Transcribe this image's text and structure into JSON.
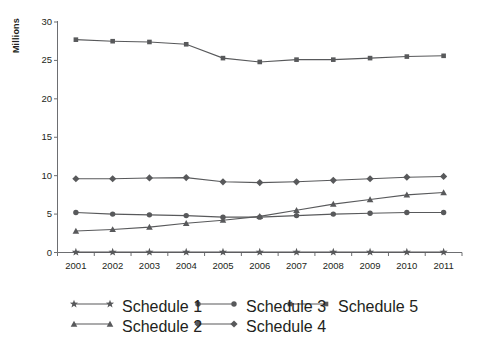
{
  "chart_data": {
    "type": "line",
    "title": "",
    "xlabel": "",
    "ylabel": "Millions",
    "categories": [
      "2001",
      "2002",
      "2003",
      "2004",
      "2005",
      "2006",
      "2007",
      "2008",
      "2009",
      "2010",
      "2011"
    ],
    "ylim": [
      0,
      30
    ],
    "yticks": [
      0,
      5,
      10,
      15,
      20,
      25,
      30
    ],
    "grid": false,
    "legend_position": "bottom",
    "series": [
      {
        "name": "Schedule 1",
        "marker": "star",
        "color": "#58595b",
        "values": [
          0.05,
          0.05,
          0.05,
          0.05,
          0.05,
          0.05,
          0.05,
          0.05,
          0.05,
          0.05,
          0.05
        ]
      },
      {
        "name": "Schedule 2",
        "marker": "triangle",
        "color": "#58595b",
        "values": [
          2.8,
          3.0,
          3.3,
          3.8,
          4.2,
          4.7,
          5.5,
          6.3,
          6.9,
          7.5,
          7.8
        ]
      },
      {
        "name": "Schedule 3",
        "marker": "circle",
        "color": "#58595b",
        "values": [
          5.2,
          5.0,
          4.9,
          4.8,
          4.6,
          4.6,
          4.8,
          5.0,
          5.1,
          5.2,
          5.2
        ]
      },
      {
        "name": "Schedule 4",
        "marker": "diamond",
        "color": "#58595b",
        "values": [
          9.6,
          9.6,
          9.7,
          9.75,
          9.2,
          9.1,
          9.2,
          9.4,
          9.6,
          9.8,
          9.9
        ]
      },
      {
        "name": "Schedule 5",
        "marker": "square",
        "color": "#58595b",
        "values": [
          27.7,
          27.5,
          27.4,
          27.1,
          25.3,
          24.8,
          25.1,
          25.1,
          25.3,
          25.5,
          25.6
        ]
      }
    ]
  },
  "legend": {
    "entries": [
      {
        "label": "Schedule 1",
        "marker": "star"
      },
      {
        "label": "Schedule 2",
        "marker": "triangle"
      },
      {
        "label": "Schedule 3",
        "marker": "circle"
      },
      {
        "label": "Schedule 4",
        "marker": "diamond"
      },
      {
        "label": "Schedule 5",
        "marker": "square"
      }
    ]
  },
  "colors": {
    "line": "#58595b",
    "marker": "#58595b",
    "axis": "#6d6e71",
    "text": "#231f20",
    "background": "#ffffff"
  }
}
